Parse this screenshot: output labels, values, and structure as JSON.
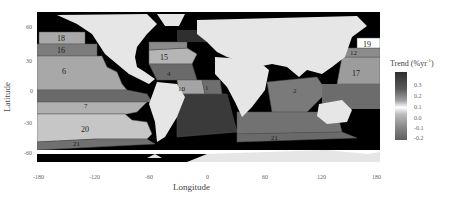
{
  "figure": {
    "type": "map",
    "xlabel": "Longitude",
    "ylabel": "Latitude",
    "x_ticks": [
      "-180",
      "-120",
      "-60",
      "0",
      "60",
      "120",
      "180"
    ],
    "y_ticks": [
      "60",
      "30",
      "0",
      "-30",
      "-60"
    ],
    "legend": {
      "title": "Trend (%yr",
      "title_sup": "-1",
      "title_close": ")",
      "ticks": [
        "0.3",
        "0.2",
        "0.1",
        "0.0",
        "-0.1",
        "-0.2"
      ]
    },
    "regions": [
      {
        "id": "1",
        "label": "1",
        "color": "#6e6e6e"
      },
      {
        "id": "2",
        "label": "2",
        "color": "#7a7a7a"
      },
      {
        "id": "4",
        "label": "4",
        "color": "#6a6a6a"
      },
      {
        "id": "6",
        "label": "6",
        "color": "#a8a8a8"
      },
      {
        "id": "7",
        "label": "7",
        "color": "#b0b0b0"
      },
      {
        "id": "10",
        "label": "10",
        "color": "#a4a4a4"
      },
      {
        "id": "12",
        "label": "12",
        "color": "#8c8c8c"
      },
      {
        "id": "15",
        "label": "15",
        "color": "#b5b5b5"
      },
      {
        "id": "16",
        "label": "16",
        "color": "#7c7c7c"
      },
      {
        "id": "17",
        "label": "17",
        "color": "#9c9c9c"
      },
      {
        "id": "18",
        "label": "18",
        "color": "#a9a9a9"
      },
      {
        "id": "19",
        "label": "19",
        "color": "#ffffff"
      },
      {
        "id": "20",
        "label": "20",
        "color": "#c6c6c6"
      },
      {
        "id": "21",
        "label": "21",
        "color": "#707070"
      }
    ]
  },
  "colors": {
    "land": "#e6e6e6",
    "coast": "#000000",
    "polar": "#000000"
  }
}
